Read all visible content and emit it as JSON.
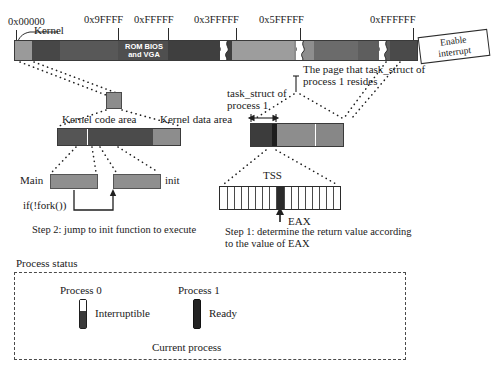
{
  "figure": {
    "title_hidden": "Linux 0.11 kernel startup: process 0 forks process 1"
  },
  "memory_map": {
    "addresses": [
      {
        "label": "0x00000",
        "x": 14,
        "tick_x": 16,
        "label_x": 8
      },
      {
        "label": "0x9FFFF",
        "x": 118,
        "tick_x": 118,
        "label_x": 84
      },
      {
        "label": "0xFFFFF",
        "x": 168,
        "tick_x": 168,
        "label_x": 134
      },
      {
        "label": "0x3FFFFF",
        "x": 236,
        "tick_x": 236,
        "label_x": 196
      },
      {
        "label": "0x5FFFFF",
        "x": 300,
        "tick_x": 300,
        "label_x": 262
      },
      {
        "label": "0xFFFFFF",
        "x": 413,
        "tick_x": 413,
        "label_x": 372
      }
    ],
    "kernel_label": "Kernel",
    "rom_bios_label_line1": "ROM BIOS",
    "rom_bios_label_line2": "and VGA",
    "segments": [
      {
        "name": "kernel",
        "left": 0,
        "width": 18,
        "color": "#9a9a9a"
      },
      {
        "name": "low-mem",
        "left": 18,
        "width": 28,
        "color": "#474747"
      },
      {
        "name": "conventional",
        "left": 46,
        "width": 58,
        "color": "#585858"
      },
      {
        "name": "rom-bios-vga",
        "left": 104,
        "width": 50,
        "color": "#4f4f4f"
      },
      {
        "name": "upper-mem",
        "left": 154,
        "width": 64,
        "color": "#3f3f3f"
      },
      {
        "name": "ext-mem-a",
        "left": 226,
        "width": 54,
        "color": "#9d9d9d"
      },
      {
        "name": "ext-mem-b",
        "left": 280,
        "width": 12,
        "color": "#8e8e8e"
      },
      {
        "name": "ext-mem-c",
        "left": 300,
        "width": 44,
        "color": "#6b6b6b"
      },
      {
        "name": "ext-mem-d",
        "left": 344,
        "width": 30,
        "color": "#5e5e5e"
      },
      {
        "name": "high-mem",
        "left": 382,
        "width": 22,
        "color": "#4a4a4a"
      }
    ],
    "breaks": [
      {
        "name": "break-1",
        "left": 212
      },
      {
        "name": "break-2",
        "left": 288
      },
      {
        "name": "break-3",
        "left": 370
      }
    ]
  },
  "enable_interrupt": {
    "line1": "Enable",
    "line2": "interrupt"
  },
  "kernel_area": {
    "code_label": "Kernel code area",
    "data_label": "Kernel data area",
    "segments": [
      {
        "name": "code-a",
        "left": 0,
        "width": 30,
        "color": "#555555"
      },
      {
        "name": "code-b",
        "left": 31,
        "width": 64,
        "color": "#4b4b4b"
      },
      {
        "name": "data",
        "left": 96,
        "width": 28,
        "color": "#8d8d8d"
      }
    ]
  },
  "functions_row": {
    "main_label": "Main",
    "init_label": "init",
    "fork_label": "if(!fork())",
    "step2_caption": "Step 2: jump to init function to execute"
  },
  "task_struct": {
    "label_line1": "task_struct of",
    "label_line2": "process 1",
    "page_note_line1": "The page that task_struct of",
    "page_note_line2": "process 1 resides",
    "segments": [
      {
        "name": "task-struct-region",
        "left": 0,
        "width": 22,
        "color": "#3c3c3c"
      },
      {
        "name": "task-struct-edge",
        "left": 22,
        "width": 5,
        "color": "#1d1d1d"
      },
      {
        "name": "page-rest-a",
        "left": 27,
        "width": 38,
        "color": "#8d8d8d"
      },
      {
        "name": "page-rest-b",
        "left": 66,
        "width": 28,
        "color": "#878787"
      }
    ]
  },
  "tss": {
    "label": "TSS",
    "eax_label": "EAX",
    "step1_caption_line1": "Step 1: determine the return value according",
    "step1_caption_line2": "to the value of EAX",
    "cell_count": 17,
    "eax_cell_index": 8
  },
  "process_status": {
    "panel_title": "Process status",
    "processes": [
      {
        "name": "Process 0",
        "state": "Interruptible",
        "marker_top_color": "#ffffff",
        "marker_bottom_color": "#3a3a3a",
        "marker_top_ratio": 0.38
      },
      {
        "name": "Process 1",
        "state": "Ready",
        "marker_top_color": "#232323",
        "marker_bottom_color": "#232323",
        "marker_top_ratio": 1.0
      }
    ],
    "current_process_label": "Current process"
  },
  "colors": {
    "ink": "#1a1a1a",
    "line": "#2b2b2b",
    "panel_border": "#4a4a4a"
  }
}
